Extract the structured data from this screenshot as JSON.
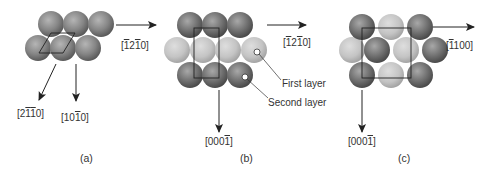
{
  "panels": [
    {
      "id": "a",
      "caption": "(a)",
      "directions": {
        "right": {
          "prefix": "[",
          "d1": "1",
          "d2": "2",
          "d3": "1",
          "d4": "0",
          "suffix": "]",
          "bars": [
            true,
            false,
            true,
            false
          ],
          "text": "[-12-10]"
        },
        "diagonal": {
          "text": "[2-1-10]",
          "prefix": "[",
          "d1": "2",
          "d2": "1",
          "d3": "1",
          "d4": "0",
          "suffix": "]"
        },
        "down": {
          "text": "[10-10]",
          "prefix": "[",
          "d1": "1",
          "d2": "0",
          "d3": "1",
          "d4": "0",
          "suffix": "]"
        }
      }
    },
    {
      "id": "b",
      "caption": "(b)",
      "directions": {
        "right": {
          "text": "[-12-10]",
          "prefix": "[",
          "d1": "1",
          "d2": "2",
          "d3": "1",
          "d4": "0",
          "suffix": "]"
        },
        "down": {
          "text": "[000-1]",
          "prefix": "[",
          "d1": "0",
          "d2": "0",
          "d3": "0",
          "d4": "1",
          "suffix": "]"
        }
      },
      "annotations": {
        "first_layer": "First layer",
        "second_layer": "Second layer"
      }
    },
    {
      "id": "c",
      "caption": "(c)",
      "directions": {
        "right": {
          "text": "[-1100]",
          "prefix": "[",
          "d1": "1",
          "d2": "1",
          "d3": "0",
          "d4": "0",
          "suffix": "]"
        },
        "down": {
          "text": "[000-1]",
          "prefix": "[",
          "d1": "0",
          "d2": "0",
          "d3": "0",
          "d4": "1",
          "suffix": "]"
        }
      }
    }
  ],
  "colors": {
    "dark_atom": "#6e6e6e",
    "light_atom": "#bdbdbd",
    "line": "#222222",
    "text": "#333333"
  }
}
